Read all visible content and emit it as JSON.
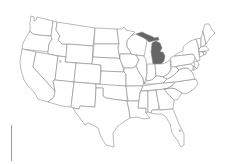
{
  "map": {
    "type": "choropleth",
    "region": "United States (contiguous)",
    "highlighted_state": "Michigan",
    "colors": {
      "highlight_fill": "#666666",
      "default_fill": "#ffffff",
      "border": "#8a8a8a",
      "background": "#ffffff"
    },
    "states": [
      {
        "id": "WA",
        "name": "Washington",
        "highlighted": false
      },
      {
        "id": "OR",
        "name": "Oregon",
        "highlighted": false
      },
      {
        "id": "CA",
        "name": "California",
        "highlighted": false
      },
      {
        "id": "ID",
        "name": "Idaho",
        "highlighted": false
      },
      {
        "id": "NV",
        "name": "Nevada",
        "highlighted": false
      },
      {
        "id": "MT",
        "name": "Montana",
        "highlighted": false
      },
      {
        "id": "WY",
        "name": "Wyoming",
        "highlighted": false
      },
      {
        "id": "UT",
        "name": "Utah",
        "highlighted": false
      },
      {
        "id": "AZ",
        "name": "Arizona",
        "highlighted": false
      },
      {
        "id": "CO",
        "name": "Colorado",
        "highlighted": false
      },
      {
        "id": "NM",
        "name": "New Mexico",
        "highlighted": false
      },
      {
        "id": "ND",
        "name": "North Dakota",
        "highlighted": false
      },
      {
        "id": "SD",
        "name": "South Dakota",
        "highlighted": false
      },
      {
        "id": "NE",
        "name": "Nebraska",
        "highlighted": false
      },
      {
        "id": "KS",
        "name": "Kansas",
        "highlighted": false
      },
      {
        "id": "OK",
        "name": "Oklahoma",
        "highlighted": false
      },
      {
        "id": "TX",
        "name": "Texas",
        "highlighted": false
      },
      {
        "id": "MN",
        "name": "Minnesota",
        "highlighted": false
      },
      {
        "id": "IA",
        "name": "Iowa",
        "highlighted": false
      },
      {
        "id": "MO",
        "name": "Missouri",
        "highlighted": false
      },
      {
        "id": "AR",
        "name": "Arkansas",
        "highlighted": false
      },
      {
        "id": "LA",
        "name": "Louisiana",
        "highlighted": false
      },
      {
        "id": "WI",
        "name": "Wisconsin",
        "highlighted": false
      },
      {
        "id": "IL",
        "name": "Illinois",
        "highlighted": false
      },
      {
        "id": "MI",
        "name": "Michigan",
        "highlighted": true
      },
      {
        "id": "IN",
        "name": "Indiana",
        "highlighted": false
      },
      {
        "id": "OH",
        "name": "Ohio",
        "highlighted": false
      },
      {
        "id": "KY",
        "name": "Kentucky",
        "highlighted": false
      },
      {
        "id": "TN",
        "name": "Tennessee",
        "highlighted": false
      },
      {
        "id": "MS",
        "name": "Mississippi",
        "highlighted": false
      },
      {
        "id": "AL",
        "name": "Alabama",
        "highlighted": false
      },
      {
        "id": "GA",
        "name": "Georgia",
        "highlighted": false
      },
      {
        "id": "FL",
        "name": "Florida",
        "highlighted": false
      },
      {
        "id": "SC",
        "name": "South Carolina",
        "highlighted": false
      },
      {
        "id": "NC",
        "name": "North Carolina",
        "highlighted": false
      },
      {
        "id": "VA",
        "name": "Virginia",
        "highlighted": false
      },
      {
        "id": "WV",
        "name": "West Virginia",
        "highlighted": false
      },
      {
        "id": "PA",
        "name": "Pennsylvania",
        "highlighted": false
      },
      {
        "id": "NY",
        "name": "New York",
        "highlighted": false
      },
      {
        "id": "VT",
        "name": "Vermont",
        "highlighted": false
      },
      {
        "id": "NH",
        "name": "New Hampshire",
        "highlighted": false
      },
      {
        "id": "ME",
        "name": "Maine",
        "highlighted": false
      },
      {
        "id": "MA",
        "name": "Massachusetts",
        "highlighted": false
      },
      {
        "id": "CT",
        "name": "Connecticut",
        "highlighted": false
      },
      {
        "id": "RI",
        "name": "Rhode Island",
        "highlighted": false
      },
      {
        "id": "NJ",
        "name": "New Jersey",
        "highlighted": false
      },
      {
        "id": "DE",
        "name": "Delaware",
        "highlighted": false
      },
      {
        "id": "MD",
        "name": "Maryland",
        "highlighted": false
      }
    ]
  },
  "legend": {
    "scale_bar": "vertical gray line, no visible labels"
  }
}
